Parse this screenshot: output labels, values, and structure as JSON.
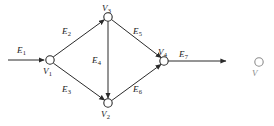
{
  "figure": {
    "kind": "directed-graph-diagram",
    "background_color": "#ffffff",
    "line_color": "#2b2b2b",
    "text_color": "#222222"
  },
  "nodes": [
    {
      "id": "v1",
      "label": "V",
      "sub": "1",
      "cx": 50,
      "cy": 60,
      "r": 4.2,
      "label_x": 43,
      "label_y": 67
    },
    {
      "id": "v2",
      "label": "V",
      "sub": "2",
      "cx": 108,
      "cy": 103,
      "r": 4.2,
      "label_x": 101,
      "label_y": 110
    },
    {
      "id": "v3",
      "label": "V",
      "sub": "3",
      "cx": 108,
      "cy": 17,
      "r": 4.2,
      "label_x": 102,
      "label_y": 4
    },
    {
      "id": "v4",
      "label": "V",
      "sub": "4",
      "cx": 164,
      "cy": 61,
      "r": 4.2,
      "label_x": 158,
      "label_y": 48
    }
  ],
  "edges": [
    {
      "id": "e1",
      "label": "E",
      "sub": "1",
      "from": "source",
      "to": "v1",
      "label_x": 17,
      "label_y": 46
    },
    {
      "id": "e2",
      "label": "E",
      "sub": "2",
      "from": "v1",
      "to": "v3",
      "label_x": 62,
      "label_y": 27
    },
    {
      "id": "e3",
      "label": "E",
      "sub": "3",
      "from": "v1",
      "to": "v2",
      "label_x": 62,
      "label_y": 85
    },
    {
      "id": "e4",
      "label": "E",
      "sub": "4",
      "from": "v3",
      "to": "v2",
      "label_x": 92,
      "label_y": 56
    },
    {
      "id": "e5",
      "label": "E",
      "sub": "5",
      "from": "v3",
      "to": "v4",
      "label_x": 133,
      "label_y": 27
    },
    {
      "id": "e6",
      "label": "E",
      "sub": "6",
      "from": "v2",
      "to": "v4",
      "label_x": 133,
      "label_y": 85
    },
    {
      "id": "e7",
      "label": "E",
      "sub": "7",
      "from": "v4",
      "to": "sink",
      "label_x": 179,
      "label_y": 50
    }
  ],
  "neighbor_figure": {
    "node_label": "V",
    "cx": 259,
    "cy": 62,
    "r": 4.2,
    "label_x": 252,
    "label_y": 69
  }
}
